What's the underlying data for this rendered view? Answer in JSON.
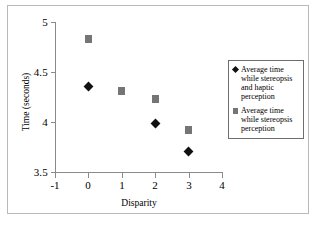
{
  "chart_data": {
    "type": "scatter",
    "title": "",
    "xlabel": "Disparity",
    "ylabel": "Time (seconds)",
    "xlim": [
      -1,
      4
    ],
    "ylim": [
      3.5,
      5
    ],
    "xticks": [
      "-1",
      "0",
      "1",
      "2",
      "3",
      "4"
    ],
    "yticks": [
      "5",
      "4.5",
      "4",
      "3.5"
    ],
    "grid": false,
    "legend_position": "right",
    "x": [
      0,
      1,
      2,
      3
    ],
    "series": [
      {
        "name": "Average time while stereopsis and haptic perception",
        "marker": "diamond",
        "color": "#111111",
        "values": [
          4.36,
          null,
          3.99,
          3.71
        ]
      },
      {
        "name": "Average time while stereopsis perception",
        "marker": "square",
        "color": "#757575",
        "values": [
          4.83,
          4.31,
          4.23,
          3.92
        ]
      }
    ],
    "points": [
      {
        "series": 0,
        "x": 0,
        "y": 4.36
      },
      {
        "series": 0,
        "x": 2,
        "y": 3.99
      },
      {
        "series": 0,
        "x": 3,
        "y": 3.71
      },
      {
        "series": 1,
        "x": 0,
        "y": 4.83
      },
      {
        "series": 1,
        "x": 1,
        "y": 4.31
      },
      {
        "series": 1,
        "x": 2,
        "y": 4.23
      },
      {
        "series": 1,
        "x": 3,
        "y": 3.92
      }
    ]
  },
  "legend": {
    "entries": [
      {
        "label": "Average time while stereopsis and haptic perception",
        "marker": "diamond"
      },
      {
        "label": "Average time while stereopsis perception",
        "marker": "square"
      }
    ]
  }
}
